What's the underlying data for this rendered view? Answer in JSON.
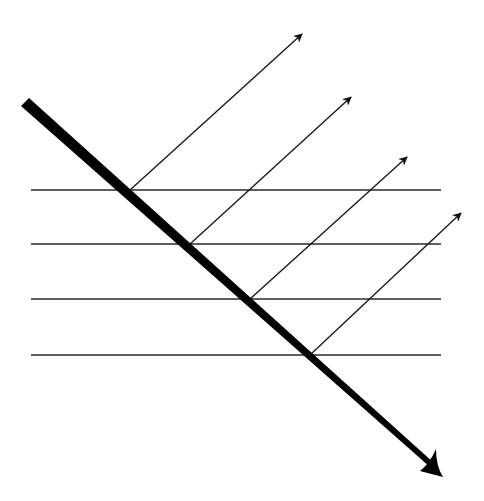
{
  "diagram": {
    "colors": {
      "stroke": "#1a1a1a",
      "background": "#ffffff"
    },
    "horizontal_lines": [
      {
        "y": 190,
        "x1": 31,
        "x2": 441
      },
      {
        "y": 244,
        "x1": 31,
        "x2": 441
      },
      {
        "y": 299,
        "x1": 31,
        "x2": 441
      },
      {
        "y": 355,
        "x1": 31,
        "x2": 441
      }
    ],
    "main_arrow": {
      "start": [
        25,
        102
      ],
      "tip": [
        443,
        476
      ],
      "start_width": 11,
      "end_width": 3
    },
    "emitted_arrows": [
      {
        "from": [
          130,
          190
        ],
        "to": [
          303,
          33
        ]
      },
      {
        "from": [
          190,
          244
        ],
        "to": [
          352,
          96
        ]
      },
      {
        "from": [
          250,
          299
        ],
        "to": [
          408,
          156
        ]
      },
      {
        "from": [
          310,
          355
        ],
        "to": [
          462,
          212
        ]
      }
    ]
  }
}
